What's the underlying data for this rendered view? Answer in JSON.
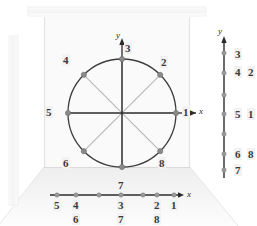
{
  "figure": {
    "type": "unit-circle-projection-diagram",
    "background_color": "#ffffff",
    "wall_color": "#f7f7f7",
    "floor_color": "#f0f0f0",
    "circle_color": "#3d3d3d",
    "axis_color": "#2b2b2b",
    "diagonal_color": "#b6b6b6",
    "dot_color": "#8a8a8a",
    "label_bg": "#f2f2f2",
    "label_color": "#3a3a3a"
  },
  "circle": {
    "center_x": 122,
    "center_y": 113,
    "radius": 54,
    "axis_labels": {
      "y": "y",
      "x": "x"
    },
    "points": [
      {
        "id": "1",
        "label": "1",
        "angle_deg": 0,
        "lx": 182,
        "ly": 107
      },
      {
        "id": "2",
        "label": "2",
        "angle_deg": 45,
        "lx": 160,
        "ly": 57
      },
      {
        "id": "3",
        "label": "3",
        "angle_deg": 90,
        "lx": 124,
        "ly": 42
      },
      {
        "id": "4",
        "label": "4",
        "angle_deg": 135,
        "lx": 63,
        "ly": 55
      },
      {
        "id": "5",
        "label": "5",
        "angle_deg": 180,
        "lx": 45,
        "ly": 107
      },
      {
        "id": "6",
        "label": "6",
        "angle_deg": 225,
        "lx": 63,
        "ly": 158
      },
      {
        "id": "7",
        "label": "7",
        "angle_deg": 270,
        "lx": 117,
        "ly": 179
      },
      {
        "id": "8",
        "label": "8",
        "angle_deg": 315,
        "lx": 158,
        "ly": 158
      }
    ]
  },
  "x_axis_projection": {
    "axis_label": "x",
    "y_pos": 195,
    "x_start": 56,
    "x_end": 180,
    "ticks": [
      {
        "label_top": "5",
        "label_bottom": "",
        "x": 57
      },
      {
        "label_top": "4",
        "label_bottom": "6",
        "x": 76
      },
      {
        "label_top": "3",
        "label_bottom": "7",
        "x": 121
      },
      {
        "label_top": "2",
        "label_bottom": "8",
        "x": 157
      },
      {
        "label_top": "1",
        "label_bottom": "",
        "x": 174
      }
    ]
  },
  "y_axis_projection": {
    "axis_label": "y",
    "x_pos": 224,
    "y_top": 37,
    "y_bottom": 178,
    "ticks": [
      {
        "label_left": "3",
        "label_right": "",
        "y": 53
      },
      {
        "label_left": "4",
        "label_right": "2",
        "y": 73
      },
      {
        "label_left": "5",
        "label_right": "1",
        "y": 114
      },
      {
        "label_left": "6",
        "label_right": "8",
        "y": 154
      },
      {
        "label_left": "7",
        "label_right": "",
        "y": 170
      }
    ]
  }
}
